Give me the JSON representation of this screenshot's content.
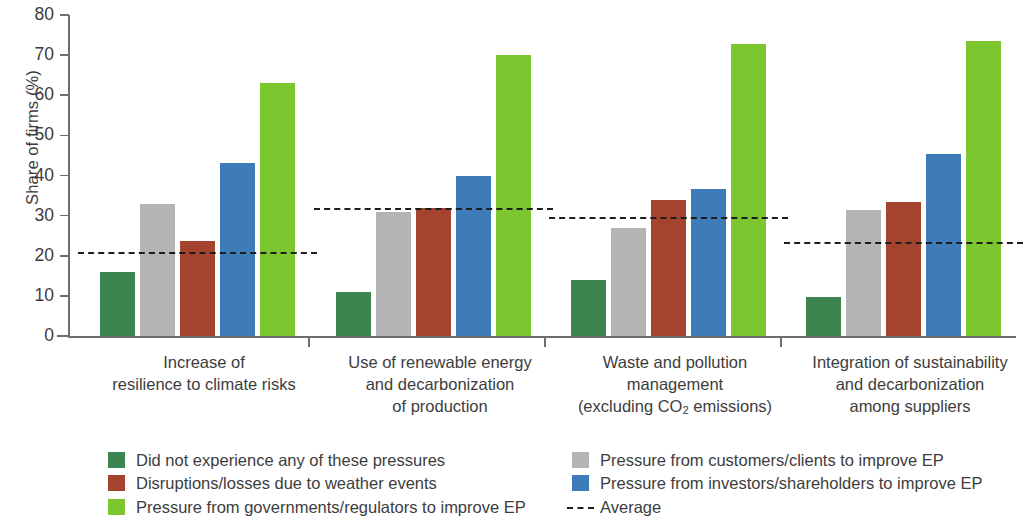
{
  "chart_data": {
    "type": "bar",
    "title": "",
    "xlabel": "",
    "ylabel": "Share of firms (%)",
    "ylim": [
      0,
      80
    ],
    "ytick_labels": [
      "0",
      "10",
      "20",
      "30",
      "40",
      "50",
      "60",
      "70",
      "80"
    ],
    "ytick_values": [
      0,
      10,
      20,
      30,
      40,
      50,
      60,
      70,
      80
    ],
    "grid": false,
    "legend_position": "bottom",
    "categories": [
      "Increase of resilience to climate risks",
      "Use of renewable energy and decarbonization of production",
      "Waste and pollution management (excluding CO2 emissions)",
      "Integration of sustainability and decarbonization among suppliers"
    ],
    "category_lines": [
      [
        "Increase of",
        "resilience to climate risks"
      ],
      [
        "Use of renewable energy",
        "and decarbonization",
        "of production"
      ],
      [
        "Waste and pollution",
        "management",
        "(excluding CO₂ emissions)"
      ],
      [
        "Integration of sustainability",
        "and decarbonization",
        "among suppliers"
      ]
    ],
    "series": [
      {
        "name": "Did not experience any of these pressures",
        "color": "#3c8450",
        "values": [
          16.0,
          11.0,
          14.0,
          9.7
        ]
      },
      {
        "name": "Pressure from customers/clients to improve EP",
        "color": "#b4b4b4",
        "values": [
          33.0,
          31.0,
          26.8,
          31.5
        ]
      },
      {
        "name": "Disruptions/losses due to weather events",
        "color": "#a4442e",
        "values": [
          23.8,
          32.0,
          33.8,
          33.5
        ]
      },
      {
        "name": "Pressure from investors/shareholders to improve EP",
        "color": "#3d7cb8",
        "values": [
          43.0,
          39.8,
          36.6,
          45.4
        ]
      },
      {
        "name": "Pressure from governments/regulators to improve EP",
        "color": "#7cc62f",
        "values": [
          63.0,
          70.0,
          72.7,
          73.6
        ]
      }
    ],
    "average_line": {
      "name": "Average",
      "color": "#1d1d1d",
      "style": "dashed",
      "values": [
        21.0,
        32.0,
        29.7,
        23.4
      ]
    }
  },
  "legend": {
    "left_items": [
      {
        "label": "Did not experience any of these pressures",
        "color": "#3c8450",
        "marker": "square"
      },
      {
        "label": "Disruptions/losses due to weather events",
        "color": "#a4442e",
        "marker": "square"
      },
      {
        "label": "Pressure from governments/regulators to improve EP",
        "color": "#7cc62f",
        "marker": "square"
      }
    ],
    "right_items": [
      {
        "label": "Pressure from customers/clients to improve EP",
        "color": "#b4b4b4",
        "marker": "square"
      },
      {
        "label": "Pressure from investors/shareholders to improve EP",
        "color": "#3d7cb8",
        "marker": "square"
      },
      {
        "label": "Average",
        "color": "#1d1d1d",
        "marker": "dashed-line"
      }
    ]
  }
}
